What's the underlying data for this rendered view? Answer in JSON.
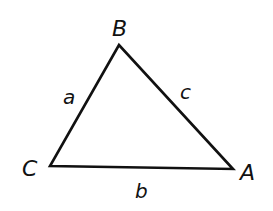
{
  "diagram": {
    "type": "triangle",
    "stroke_color": "#111111",
    "background": "#ffffff",
    "vertices": [
      {
        "id": "B",
        "label": "B",
        "x": 119,
        "y": 45,
        "label_x": 112,
        "label_y": 36
      },
      {
        "id": "C",
        "label": "C",
        "x": 50,
        "y": 166,
        "label_x": 22,
        "label_y": 176
      },
      {
        "id": "A",
        "label": "A",
        "x": 233,
        "y": 169,
        "label_x": 240,
        "label_y": 180
      }
    ],
    "sides": [
      {
        "id": "a",
        "label": "a",
        "from": "B",
        "to": "C",
        "label_x": 63,
        "label_y": 104
      },
      {
        "id": "c",
        "label": "c",
        "from": "B",
        "to": "A",
        "label_x": 180,
        "label_y": 99
      },
      {
        "id": "b",
        "label": "b",
        "from": "C",
        "to": "A",
        "label_x": 135,
        "label_y": 198
      }
    ]
  }
}
